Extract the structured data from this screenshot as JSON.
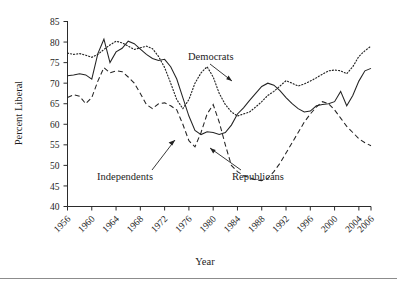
{
  "chart_data": {
    "type": "line",
    "title": "",
    "xlabel": "Year",
    "ylabel": "Percent Liberal",
    "xlim": [
      1956,
      2006
    ],
    "ylim": [
      40,
      85
    ],
    "grid": false,
    "legend": "annotations-inline",
    "xticks": [
      1956,
      1960,
      1964,
      1968,
      1972,
      1976,
      1980,
      1984,
      1988,
      1992,
      1996,
      2000,
      2004,
      2006
    ],
    "xtick_labels": [
      "1956",
      "1960",
      "1964",
      "1968",
      "1972",
      "1976",
      "1980",
      "1984",
      "1988",
      "1992",
      "1996",
      "2000",
      "2004",
      "2006"
    ],
    "yticks": [
      40,
      45,
      50,
      55,
      60,
      65,
      70,
      75,
      80,
      85
    ],
    "ytick_labels": [
      "40",
      "45",
      "50",
      "55",
      "60",
      "65",
      "70",
      "75",
      "80",
      "85"
    ],
    "x": [
      1956,
      1957,
      1958,
      1959,
      1960,
      1961,
      1962,
      1963,
      1964,
      1965,
      1966,
      1967,
      1968,
      1969,
      1970,
      1971,
      1972,
      1973,
      1974,
      1975,
      1976,
      1977,
      1978,
      1979,
      1980,
      1981,
      1982,
      1983,
      1984,
      1985,
      1986,
      1987,
      1988,
      1989,
      1990,
      1991,
      1992,
      1993,
      1994,
      1995,
      1996,
      1997,
      1998,
      1999,
      2000,
      2001,
      2002,
      2003,
      2004,
      2005,
      2006
    ],
    "series": [
      {
        "name": "Democrats",
        "style": "dotted",
        "values": [
          77.3,
          77.0,
          77.2,
          76.8,
          76.3,
          77.0,
          78.2,
          79.3,
          80.2,
          79.8,
          79.0,
          78.2,
          78.6,
          79.0,
          78.4,
          76.5,
          73.8,
          70.0,
          66.0,
          63.8,
          66.0,
          70.0,
          72.5,
          74.0,
          71.5,
          67.5,
          64.8,
          63.0,
          62.0,
          62.5,
          63.0,
          64.2,
          65.5,
          67.0,
          68.0,
          69.3,
          70.6,
          70.0,
          69.3,
          69.8,
          70.5,
          71.3,
          72.2,
          73.0,
          73.2,
          73.0,
          72.3,
          74.0,
          76.5,
          77.9,
          79.0
        ]
      },
      {
        "name": "Independents",
        "style": "solid",
        "values": [
          71.8,
          72.0,
          72.3,
          72.0,
          71.0,
          77.2,
          80.7,
          75.0,
          77.6,
          78.5,
          80.2,
          79.6,
          78.3,
          77.0,
          76.0,
          75.5,
          75.8,
          74.0,
          71.0,
          66.5,
          62.0,
          58.5,
          57.5,
          58.2,
          58.0,
          57.5,
          58.0,
          59.8,
          62.5,
          64.0,
          65.8,
          67.5,
          69.2,
          70.0,
          69.5,
          68.2,
          66.5,
          65.0,
          63.8,
          63.0,
          63.2,
          64.5,
          64.8,
          65.0,
          65.5,
          68.0,
          64.5,
          67.0,
          70.5,
          73.0,
          73.6
        ]
      },
      {
        "name": "Republicans",
        "style": "dashed",
        "values": [
          66.5,
          67.2,
          66.8,
          65.0,
          66.5,
          70.5,
          73.8,
          72.5,
          73.0,
          72.8,
          71.5,
          70.0,
          67.5,
          64.8,
          63.8,
          65.0,
          65.2,
          64.5,
          63.5,
          60.0,
          56.0,
          54.5,
          58.0,
          62.5,
          64.8,
          60.5,
          55.0,
          50.0,
          48.5,
          47.5,
          47.0,
          46.5,
          46.3,
          46.8,
          48.5,
          50.5,
          53.0,
          55.5,
          58.0,
          60.5,
          62.5,
          64.2,
          65.5,
          65.0,
          63.5,
          61.5,
          59.5,
          58.0,
          56.5,
          55.5,
          54.8
        ]
      }
    ],
    "annotations": [
      {
        "label": "Democrats",
        "points_to_series": "Democrats",
        "arrow": true
      },
      {
        "label": "Independents",
        "points_to_series": "Independents",
        "arrow": true
      },
      {
        "label": "Republicans",
        "points_to_series": "Republicans",
        "arrow": true
      }
    ]
  },
  "axis": {
    "ylabel": "Percent Liberal",
    "xlabel": "Year"
  }
}
